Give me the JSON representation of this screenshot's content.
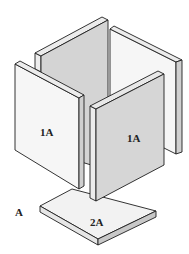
{
  "diagram": {
    "type": "isometric exploded panel assembly",
    "figure_label": "A",
    "parts": [
      {
        "id": "left-front-panel",
        "label": "1A"
      },
      {
        "id": "right-front-panel",
        "label": "1A"
      },
      {
        "id": "back-left-panel",
        "label": ""
      },
      {
        "id": "back-right-panel",
        "label": ""
      },
      {
        "id": "base-slab",
        "label": "2A"
      }
    ]
  },
  "colors": {
    "light_face": "#f4f4f4",
    "gray_face": "#d6d6d6",
    "edge_face": "#e2e2e2",
    "dark_edge": "#bdbdbd",
    "line": "#1e1e1e"
  }
}
